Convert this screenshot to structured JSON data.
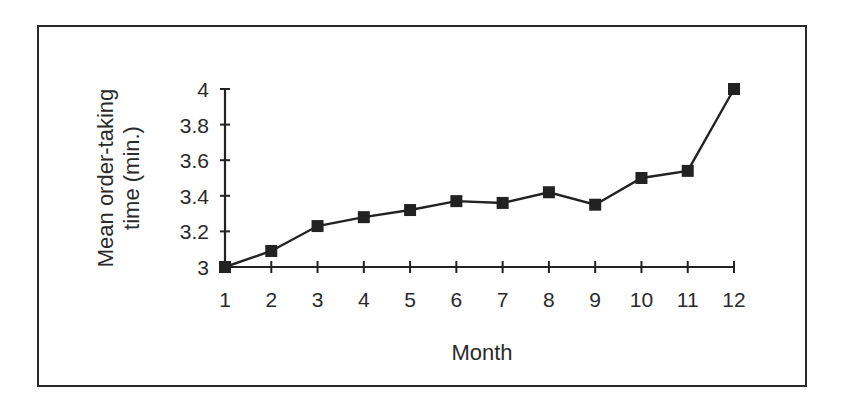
{
  "chart_data": {
    "type": "line",
    "title": "",
    "xlabel": "Month",
    "ylabel": "Mean order-taking time (min.)",
    "ylabel_lines": [
      "Mean order-taking",
      "time (min.)"
    ],
    "categories": [
      "1",
      "2",
      "3",
      "4",
      "5",
      "6",
      "7",
      "8",
      "9",
      "10",
      "11",
      "12"
    ],
    "x": [
      1,
      2,
      3,
      4,
      5,
      6,
      7,
      8,
      9,
      10,
      11,
      12
    ],
    "values": [
      3.0,
      3.09,
      3.23,
      3.28,
      3.32,
      3.37,
      3.36,
      3.42,
      3.35,
      3.5,
      3.54,
      4.0
    ],
    "series": [
      {
        "name": "Mean order-taking time",
        "values": [
          3.0,
          3.09,
          3.23,
          3.28,
          3.32,
          3.37,
          3.36,
          3.42,
          3.35,
          3.5,
          3.54,
          4.0
        ],
        "marker": "square",
        "color": "#222222"
      }
    ],
    "ylim": [
      3,
      4
    ],
    "yticks": [
      "3",
      "3.2",
      "3.4",
      "3.6",
      "3.8",
      "4"
    ],
    "ytick_values": [
      3,
      3.2,
      3.4,
      3.6,
      3.8,
      4
    ],
    "grid": false,
    "legend": null
  }
}
